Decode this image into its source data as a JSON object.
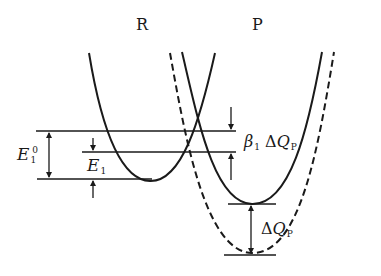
{
  "labels": {
    "reactant": "R",
    "product": "P",
    "e1_zero": {
      "base": "E",
      "sub": "1",
      "sup": "0"
    },
    "e1": {
      "base": "E",
      "sub": "1"
    },
    "beta_delta": {
      "beta": "β",
      "beta_sub": "1",
      "delta": "Δ",
      "q": "Q",
      "q_sub": "P"
    },
    "delta_qp": {
      "delta": "Δ",
      "q": "Q",
      "q_sub": "P"
    }
  },
  "curves": [
    {
      "name": "R",
      "style": "solid",
      "min_x": 150,
      "min_y": 180
    },
    {
      "name": "P",
      "style": "solid",
      "min_x": 252,
      "min_y": 204
    },
    {
      "name": "P-shifted",
      "style": "dashed",
      "min_x": 252,
      "min_y": 253
    }
  ],
  "colors": {
    "ink": "#1a1a1a",
    "background": "#ffffff"
  }
}
